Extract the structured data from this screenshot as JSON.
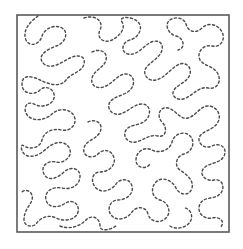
{
  "diagram": {
    "type": "stipple-meander-quilting-pattern",
    "frame": {
      "shape": "square",
      "x": 17,
      "y": 15,
      "width": 212,
      "height": 217,
      "stroke_color": "#5a5a5a"
    },
    "line": {
      "style": "dashed",
      "color": "#4a4a4a",
      "continuous": true
    },
    "background_color": "#ffffff",
    "labels": []
  }
}
